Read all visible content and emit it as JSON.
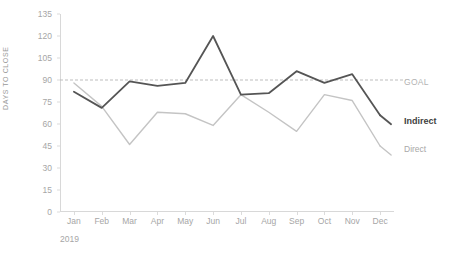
{
  "chart_data": {
    "type": "line",
    "title": "",
    "xlabel": "2019",
    "ylabel": "DAYS TO CLOSE",
    "categories": [
      "Jan",
      "Feb",
      "Mar",
      "Apr",
      "May",
      "Jun",
      "Jul",
      "Aug",
      "Sep",
      "Oct",
      "Nov",
      "Dec"
    ],
    "ylim": [
      0,
      135
    ],
    "yticks": [
      0,
      15,
      30,
      45,
      60,
      75,
      90,
      105,
      120,
      135
    ],
    "grid": false,
    "legend_position": "right",
    "series": [
      {
        "name": "Indirect",
        "color": "#555555",
        "emphasis": "bold",
        "values": [
          82,
          71,
          89,
          86,
          88,
          120,
          80,
          81,
          96,
          88,
          94,
          66
        ]
      },
      {
        "name": "Direct",
        "color": "#c4c4c4",
        "emphasis": "normal",
        "values": [
          88,
          72,
          46,
          68,
          67,
          59,
          80,
          68,
          55,
          80,
          76,
          45
        ]
      }
    ],
    "reference_line": {
      "name": "GOAL",
      "value": 90,
      "style": "dashed",
      "color": "#bdbdbd"
    }
  },
  "labels": {
    "goal": "GOAL",
    "indirect": "Indirect",
    "direct": "Direct",
    "year": "2019",
    "y_axis_title": "DAYS TO CLOSE"
  }
}
